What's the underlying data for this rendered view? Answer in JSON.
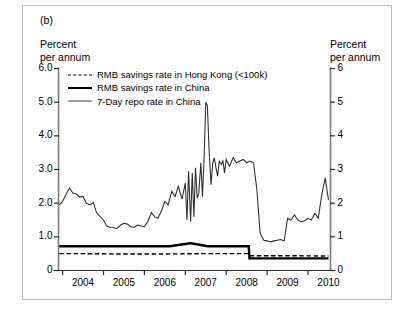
{
  "panel": {
    "label": "(b)"
  },
  "axis_titles": {
    "left": "Percent\nper annum",
    "right": "Percent\nper annum"
  },
  "legend": {
    "items": [
      {
        "key": "dashed",
        "label": "RMB savings rate in Hong Kong (<100k)"
      },
      {
        "key": "thick",
        "label": "RMB savings rate in China"
      },
      {
        "key": "thin",
        "label": "7-Day repo rate in China"
      }
    ]
  },
  "ticks": {
    "left": [
      "6.0",
      "5.0",
      "4.0",
      "3.0",
      "2.0",
      "1.0",
      "0"
    ],
    "right": [
      "6",
      "5",
      "4",
      "3",
      "2",
      "1",
      "0"
    ],
    "x": [
      "2004",
      "2005",
      "2006",
      "2007",
      "2008",
      "2009",
      "2010"
    ]
  },
  "chart_data": {
    "type": "line",
    "title": "",
    "xlabel": "",
    "ylabel": "Percent per annum",
    "xlim": [
      2003.9,
      2010.55
    ],
    "ylim": [
      0,
      6
    ],
    "grid": false,
    "legend_position": "top-left inside plot",
    "yticks": [
      0,
      1,
      2,
      3,
      4,
      5,
      6
    ],
    "xticks": [
      2004,
      2005,
      2006,
      2007,
      2008,
      2009,
      2010
    ],
    "series": [
      {
        "name": "7-Day repo rate in China",
        "style": "solid-thin",
        "color": "#2b2b2b",
        "x": [
          2003.92,
          2004.0,
          2004.08,
          2004.17,
          2004.25,
          2004.33,
          2004.42,
          2004.5,
          2004.58,
          2004.67,
          2004.75,
          2004.83,
          2004.92,
          2005.0,
          2005.08,
          2005.17,
          2005.25,
          2005.33,
          2005.42,
          2005.5,
          2005.58,
          2005.67,
          2005.75,
          2005.83,
          2005.92,
          2006.0,
          2006.08,
          2006.17,
          2006.25,
          2006.33,
          2006.42,
          2006.5,
          2006.58,
          2006.67,
          2006.75,
          2006.83,
          2006.92,
          2007.0,
          2007.04,
          2007.08,
          2007.13,
          2007.17,
          2007.21,
          2007.25,
          2007.29,
          2007.33,
          2007.38,
          2007.42,
          2007.46,
          2007.5,
          2007.54,
          2007.58,
          2007.63,
          2007.67,
          2007.71,
          2007.75,
          2007.79,
          2007.83,
          2007.88,
          2007.92,
          2007.96,
          2008.0,
          2008.08,
          2008.17,
          2008.25,
          2008.33,
          2008.42,
          2008.5,
          2008.58,
          2008.67,
          2008.75,
          2008.83,
          2008.92,
          2009.0,
          2009.08,
          2009.17,
          2009.25,
          2009.33,
          2009.42,
          2009.5,
          2009.58,
          2009.67,
          2009.75,
          2009.83,
          2009.92,
          2010.0,
          2010.08,
          2010.17,
          2010.25,
          2010.33,
          2010.42,
          2010.5
        ],
        "y": [
          1.95,
          2.05,
          2.25,
          2.45,
          2.3,
          2.28,
          2.18,
          2.2,
          2.0,
          1.95,
          2.02,
          1.72,
          1.6,
          1.5,
          1.32,
          1.28,
          1.27,
          1.25,
          1.35,
          1.4,
          1.38,
          1.3,
          1.28,
          1.35,
          1.32,
          1.3,
          1.45,
          1.72,
          1.6,
          1.55,
          1.78,
          2.05,
          1.95,
          2.35,
          2.2,
          2.5,
          2.12,
          2.6,
          1.5,
          2.95,
          1.45,
          2.9,
          1.6,
          3.05,
          2.15,
          2.3,
          3.2,
          2.2,
          3.35,
          5.0,
          4.9,
          3.6,
          2.55,
          3.2,
          3.35,
          3.05,
          2.8,
          3.25,
          3.15,
          3.25,
          2.9,
          3.3,
          3.1,
          3.35,
          3.2,
          3.25,
          3.3,
          3.2,
          3.25,
          3.2,
          2.4,
          1.1,
          0.9,
          0.88,
          0.85,
          0.88,
          0.9,
          0.92,
          0.88,
          1.55,
          1.5,
          1.65,
          1.5,
          1.45,
          1.48,
          1.55,
          1.5,
          1.7,
          1.55,
          2.2,
          2.75,
          2.1
        ]
      },
      {
        "name": "RMB savings rate in China",
        "style": "solid-thick",
        "color": "#000000",
        "x": [
          2003.92,
          2006.6,
          2006.62,
          2007.12,
          2007.14,
          2007.55,
          2007.57,
          2008.55,
          2008.57,
          2010.5
        ],
        "y": [
          0.72,
          0.72,
          0.72,
          0.81,
          0.81,
          0.72,
          0.72,
          0.72,
          0.36,
          0.36
        ]
      },
      {
        "name": "RMB savings rate in Hong Kong (<100k)",
        "style": "dashed",
        "color": "#000000",
        "x": [
          2003.92,
          2004.6,
          2005.4,
          2006.4,
          2007.4,
          2008.4,
          2008.56,
          2008.58,
          2009.4,
          2010.5
        ],
        "y": [
          0.5,
          0.5,
          0.49,
          0.49,
          0.5,
          0.5,
          0.5,
          0.44,
          0.44,
          0.43
        ]
      }
    ]
  }
}
